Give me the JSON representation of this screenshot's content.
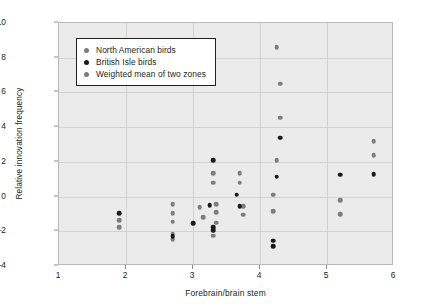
{
  "chart_data": {
    "type": "scatter",
    "title": "",
    "xlabel": "Forebrain/brain stem",
    "ylabel": "Relative innovation frequency",
    "xlim": [
      1,
      6
    ],
    "ylim": [
      -4,
      10
    ],
    "xticks": [
      "1",
      "2",
      "3",
      "4",
      "5",
      "6"
    ],
    "yticks": [
      "10",
      "8",
      "6",
      "4",
      "2",
      "0",
      "-2",
      "-4"
    ],
    "grid": true,
    "legend_position": "upper-left-inside",
    "colors": {
      "north_american": "#7d7d7d",
      "british_isle": "#1a1a1a",
      "weighted_mean": "#7d7d7d",
      "plot_background": "#ebebeb",
      "gridline": "#d2d2d2",
      "frame": "#b9b9b9",
      "text": "#231f20"
    },
    "series": [
      {
        "name": "North American birds",
        "marker": "circle",
        "color": "#7d7d7d",
        "points": [
          [
            1.9,
            -1.35
          ],
          [
            1.9,
            -1.75
          ],
          [
            2.7,
            -0.45
          ],
          [
            2.7,
            -0.95
          ],
          [
            2.7,
            -1.45
          ],
          [
            2.7,
            -2.15
          ],
          [
            2.7,
            -2.45
          ],
          [
            3.1,
            -0.6
          ],
          [
            3.15,
            -1.2
          ],
          [
            3.3,
            1.35
          ],
          [
            3.3,
            0.8
          ],
          [
            3.35,
            -0.45
          ],
          [
            3.35,
            -0.9
          ],
          [
            3.35,
            -1.5
          ],
          [
            3.3,
            -2.25
          ],
          [
            3.7,
            1.35
          ],
          [
            3.7,
            0.8
          ],
          [
            3.75,
            -0.55
          ],
          [
            3.75,
            -1.05
          ],
          [
            4.25,
            8.6
          ],
          [
            4.3,
            6.5
          ],
          [
            4.3,
            4.55
          ],
          [
            4.25,
            2.1
          ],
          [
            4.2,
            0.1
          ],
          [
            4.2,
            -0.85
          ],
          [
            5.2,
            -0.2
          ],
          [
            5.2,
            -1.0
          ],
          [
            5.7,
            3.2
          ],
          [
            5.7,
            2.4
          ]
        ]
      },
      {
        "name": "British Isle birds",
        "marker": "circle",
        "color": "#1a1a1a",
        "points": [
          [
            1.9,
            -0.95
          ],
          [
            2.7,
            -2.3
          ],
          [
            3.0,
            -1.55
          ],
          [
            3.3,
            2.1
          ],
          [
            3.25,
            -0.5
          ],
          [
            3.3,
            -1.75
          ],
          [
            3.3,
            -1.95
          ],
          [
            3.65,
            0.1
          ],
          [
            3.7,
            -0.55
          ],
          [
            4.3,
            3.4
          ],
          [
            4.25,
            1.15
          ],
          [
            4.2,
            -2.55
          ],
          [
            4.2,
            -2.85
          ],
          [
            5.2,
            1.25
          ],
          [
            5.7,
            1.3
          ]
        ]
      },
      {
        "name": "Weighted mean of two zones",
        "marker": "circle",
        "color": "#7d7d7d",
        "points": []
      }
    ]
  },
  "legend": {
    "entries": [
      {
        "label": "North American birds",
        "color": "#7d7d7d"
      },
      {
        "label": "British Isle birds",
        "color": "#1a1a1a"
      },
      {
        "label": "Weighted mean of two zones",
        "color": "#7d7d7d"
      }
    ]
  }
}
